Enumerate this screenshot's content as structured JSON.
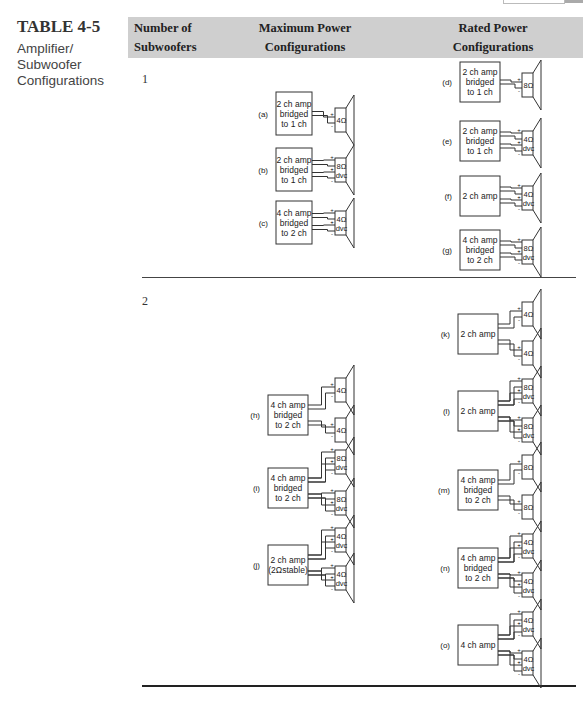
{
  "table": {
    "number": "TABLE 4-5",
    "caption_lines": [
      "Amplifier/",
      "Subwoofer",
      "Configurations"
    ]
  },
  "header": {
    "col1": [
      "Number of",
      "Subwoofers"
    ],
    "col2": [
      "Maximum Power",
      "Configurations"
    ],
    "col3": [
      "Rated Power",
      "Configurations"
    ]
  },
  "rows": [
    {
      "count": "1",
      "maximum_power": [
        {
          "label": "(a)",
          "amp": [
            "2 ch amp",
            "bridged",
            "to 1 ch"
          ],
          "speakers": [
            {
              "impedance": "4Ω",
              "dvc": false
            }
          ]
        },
        {
          "label": "(b)",
          "amp": [
            "2 ch amp",
            "bridged",
            "to 1 ch"
          ],
          "speakers": [
            {
              "impedance": "8Ω",
              "dvc": true
            }
          ]
        },
        {
          "label": "(c)",
          "amp": [
            "4 ch amp",
            "bridged",
            "to 2 ch"
          ],
          "speakers": [
            {
              "impedance": "4Ω",
              "dvc": true
            }
          ]
        }
      ],
      "rated_power": [
        {
          "label": "(d)",
          "amp": [
            "2 ch amp",
            "bridged",
            "to 1 ch"
          ],
          "speakers": [
            {
              "impedance": "8Ω",
              "dvc": false
            }
          ]
        },
        {
          "label": "(e)",
          "amp": [
            "2 ch amp",
            "bridged",
            "to 1 ch"
          ],
          "speakers": [
            {
              "impedance": "4Ω",
              "dvc": true
            }
          ]
        },
        {
          "label": "(f)",
          "amp": [
            "2 ch amp"
          ],
          "speakers": [
            {
              "impedance": "4Ω",
              "dvc": true
            }
          ]
        },
        {
          "label": "(g)",
          "amp": [
            "4 ch amp",
            "bridged",
            "to 2 ch"
          ],
          "speakers": [
            {
              "impedance": "8Ω",
              "dvc": true
            }
          ]
        }
      ]
    },
    {
      "count": "2",
      "maximum_power": [
        {
          "label": "(h)",
          "amp": [
            "4 ch amp",
            "bridged",
            "to 2 ch"
          ],
          "speakers": [
            {
              "impedance": "4Ω",
              "dvc": false
            },
            {
              "impedance": "4Ω",
              "dvc": false
            }
          ]
        },
        {
          "label": "(i)",
          "amp": [
            "4 ch amp",
            "bridged",
            "to 2 ch"
          ],
          "speakers": [
            {
              "impedance": "8Ω",
              "dvc": true
            },
            {
              "impedance": "8Ω",
              "dvc": true
            }
          ]
        },
        {
          "label": "(j)",
          "amp": [
            "2 ch amp",
            "(2Ωstable)"
          ],
          "speakers": [
            {
              "impedance": "4Ω",
              "dvc": true
            },
            {
              "impedance": "4Ω",
              "dvc": true
            }
          ]
        }
      ],
      "rated_power": [
        {
          "label": "(k)",
          "amp": [
            "2 ch amp"
          ],
          "speakers": [
            {
              "impedance": "4Ω",
              "dvc": false
            },
            {
              "impedance": "4Ω",
              "dvc": false
            }
          ]
        },
        {
          "label": "(l)",
          "amp": [
            "2 ch amp"
          ],
          "speakers": [
            {
              "impedance": "8Ω",
              "dvc": true
            },
            {
              "impedance": "8Ω",
              "dvc": true
            }
          ]
        },
        {
          "label": "(m)",
          "amp": [
            "4 ch amp",
            "bridged",
            "to 2 ch"
          ],
          "speakers": [
            {
              "impedance": "8Ω",
              "dvc": false
            },
            {
              "impedance": "8Ω",
              "dvc": false
            }
          ]
        },
        {
          "label": "(n)",
          "amp": [
            "4 ch amp",
            "bridged",
            "to 2 ch"
          ],
          "speakers": [
            {
              "impedance": "4Ω",
              "dvc": true
            },
            {
              "impedance": "4Ω",
              "dvc": true
            }
          ]
        },
        {
          "label": "(o)",
          "amp": [
            "4 ch amp"
          ],
          "speakers": [
            {
              "impedance": "4Ω",
              "dvc": true
            },
            {
              "impedance": "4Ω",
              "dvc": true
            }
          ]
        }
      ]
    }
  ],
  "dvc_label": "dvc",
  "plus_sign": "+",
  "minus_sign": "-"
}
